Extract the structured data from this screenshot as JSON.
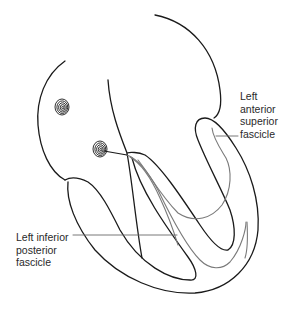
{
  "figure": {
    "colors": {
      "outline": "#1a1a1a",
      "fascicle": "#7a7a7a",
      "leader_line": "#6a6a6a",
      "text": "#2a2a2a",
      "background": "#ffffff"
    }
  },
  "labels": {
    "anterior": {
      "text": "Left\nanterior\nsuperior\nfascicle"
    },
    "posterior": {
      "text": "Left inferior\nposterior\nfascicle"
    }
  },
  "nodes": [
    {
      "name": "sinoatrial-node",
      "shape": "spiral"
    },
    {
      "name": "atrioventricular-node",
      "shape": "spiral"
    }
  ]
}
